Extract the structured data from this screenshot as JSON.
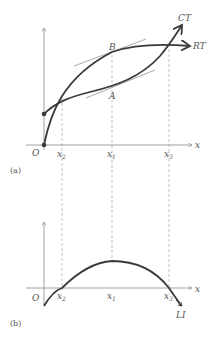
{
  "panel_a": {
    "caption": "(a)",
    "origin_label": "O",
    "x_axis_label": "x",
    "curves": [
      {
        "name": "CT",
        "label": "CT"
      },
      {
        "name": "RT",
        "label": "RT"
      }
    ],
    "points": [
      {
        "label": "B"
      },
      {
        "label": "A"
      }
    ],
    "x_ticks": [
      {
        "base": "x",
        "sub": "2"
      },
      {
        "base": "x",
        "sub": "1"
      },
      {
        "base": "x",
        "sub": "3"
      }
    ]
  },
  "panel_b": {
    "caption": "(b)",
    "origin_label": "O",
    "x_axis_label": "x",
    "curve_label": "LI",
    "x_ticks": [
      {
        "base": "x",
        "sub": "2"
      },
      {
        "base": "x",
        "sub": "1"
      },
      {
        "base": "x",
        "sub": "3"
      }
    ]
  },
  "colors": {
    "curve": "#3a3a3a",
    "axis": "#8a8a8a",
    "tangent": "#aaaaaa",
    "guide": "#9a9a9a"
  }
}
